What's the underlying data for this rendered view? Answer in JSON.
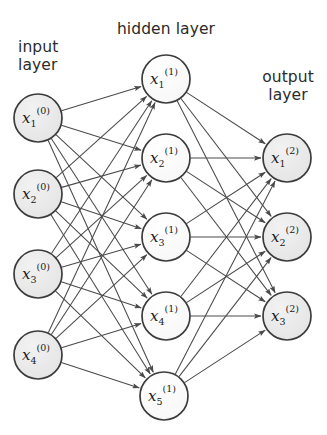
{
  "figure": {
    "title": "",
    "type": "neural-network-diagram",
    "width": 327,
    "height": 435,
    "background_color": "#ffffff"
  },
  "captions": {
    "input": "input\nlayer",
    "input_line1": "input",
    "input_line2": "layer",
    "hidden": "hidden layer",
    "output": "output\nlayer",
    "output_line1": "output",
    "output_line2": "layer"
  },
  "style": {
    "node_stroke": "#3c3c3c",
    "node_fill_shaded": "#e9e9e9",
    "node_fill_plain": "#fbfbfb",
    "edge_color": "#4a4a4a",
    "text_color": "#2b2b2b",
    "node_radius": 24
  },
  "chart_data": {
    "type": "diagram",
    "diagram_type": "feedforward-neural-network",
    "layers": [
      {
        "id": "input",
        "caption": "input layer",
        "superscript": "(0)",
        "count": 4,
        "shaded": true,
        "nodes": [
          {
            "id": "x1_0",
            "base": "x",
            "sub": "1",
            "sup": "(0)",
            "cx": 38,
            "cy": 118
          },
          {
            "id": "x2_0",
            "base": "x",
            "sub": "2",
            "sup": "(0)",
            "cx": 38,
            "cy": 194
          },
          {
            "id": "x3_0",
            "base": "x",
            "sub": "3",
            "sup": "(0)",
            "cx": 38,
            "cy": 274
          },
          {
            "id": "x4_0",
            "base": "x",
            "sub": "4",
            "sup": "(0)",
            "cx": 38,
            "cy": 355
          }
        ]
      },
      {
        "id": "hidden",
        "caption": "hidden layer",
        "superscript": "(1)",
        "count": 5,
        "shaded": false,
        "nodes": [
          {
            "id": "x1_1",
            "base": "x",
            "sub": "1",
            "sup": "(1)",
            "cx": 166,
            "cy": 79
          },
          {
            "id": "x2_1",
            "base": "x",
            "sub": "2",
            "sup": "(1)",
            "cx": 166,
            "cy": 158
          },
          {
            "id": "x3_1",
            "base": "x",
            "sub": "3",
            "sup": "(1)",
            "cx": 166,
            "cy": 237
          },
          {
            "id": "x4_1",
            "base": "x",
            "sub": "4",
            "sup": "(1)",
            "cx": 166,
            "cy": 316
          },
          {
            "id": "x5_1",
            "base": "x",
            "sub": "5",
            "sup": "(1)",
            "cx": 164,
            "cy": 396
          }
        ]
      },
      {
        "id": "output",
        "caption": "output layer",
        "superscript": "(2)",
        "count": 3,
        "shaded": true,
        "nodes": [
          {
            "id": "x1_2",
            "base": "x",
            "sub": "1",
            "sup": "(2)",
            "cx": 287,
            "cy": 158
          },
          {
            "id": "x2_2",
            "base": "x",
            "sub": "2",
            "sup": "(2)",
            "cx": 287,
            "cy": 237
          },
          {
            "id": "x3_2",
            "base": "x",
            "sub": "3",
            "sup": "(2)",
            "cx": 287,
            "cy": 316
          }
        ]
      }
    ],
    "connections": {
      "input_to_hidden": "fully-connected",
      "hidden_to_output": "fully-connected",
      "directed": true,
      "arrowheads": "at target node",
      "input_to_hidden_count": 20,
      "hidden_to_output_count": 15,
      "total_edges": 35
    }
  }
}
